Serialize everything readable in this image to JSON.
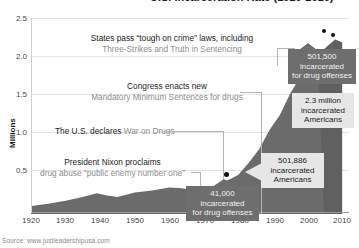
{
  "chart_data": {
    "type": "area",
    "title": "U.S. Incarceration Rate (1920-2010)",
    "xlabel": "",
    "ylabel": "Millions",
    "xlim": [
      1920,
      2012
    ],
    "ylim": [
      0,
      2.6
    ],
    "ytick_labels": [
      "0.5",
      "1.0",
      "1.5",
      "2.0",
      "2.5"
    ],
    "ytick_values": [
      0.5,
      1.0,
      1.5,
      2.0,
      2.5
    ],
    "xtick_labels": [
      "1920",
      "1930",
      "1940",
      "1950",
      "1960",
      "1970",
      "1980",
      "1990",
      "2000",
      "2010"
    ],
    "xtick_values": [
      1920,
      1930,
      1940,
      1950,
      1960,
      1970,
      1980,
      1990,
      2000,
      2010
    ],
    "grid": true,
    "legend": "none",
    "series": [
      {
        "name": "Total incarcerated Americans",
        "color": "#6b6b6b",
        "x": [
          1920,
          1925,
          1930,
          1935,
          1939,
          1942,
          1945,
          1950,
          1955,
          1960,
          1963,
          1966,
          1970,
          1973,
          1975,
          1978,
          1980,
          1983,
          1986,
          1989,
          1992,
          1995,
          1998,
          2000,
          2003,
          2005,
          2008,
          2010
        ],
        "y": [
          0.08,
          0.11,
          0.15,
          0.2,
          0.25,
          0.22,
          0.2,
          0.26,
          0.29,
          0.33,
          0.32,
          0.3,
          0.33,
          0.35,
          0.39,
          0.45,
          0.5,
          0.66,
          0.84,
          1.1,
          1.3,
          1.59,
          1.82,
          1.94,
          2.08,
          2.19,
          2.31,
          2.27
        ]
      }
    ],
    "markers": [
      {
        "x": 1980,
        "y": 0.501886,
        "label": "501,886 incarcerated Americans"
      },
      {
        "x": 2008,
        "y": 2.31,
        "label": "peak"
      },
      {
        "x": 2010,
        "y": 2.27,
        "label": "2010"
      }
    ]
  },
  "axis": {
    "y_label": "Millions",
    "y_ticks": [
      "2.5",
      "2.0",
      "1.5",
      "1.0",
      "0.5"
    ],
    "x_ticks": [
      "1920",
      "1930",
      "1940",
      "1950",
      "1960",
      "1970",
      "1980",
      "1990",
      "2000",
      "2010"
    ]
  },
  "annotations": [
    {
      "id": "tough-on-crime",
      "line1": "States pass “tough on crime” laws, including",
      "line2": "Three-Strikes and Truth in Sentencing"
    },
    {
      "id": "mandatory-minimums",
      "line1": "Congress enacts new",
      "line2": "Mandatory Minimum Sentences for drugs"
    },
    {
      "id": "war-on-drugs",
      "line1": "The U.S. declares",
      "line2": "War on Drugs"
    },
    {
      "id": "nixon",
      "line1": "President Nixon proclaims",
      "line2": "drug abuse “public enemy number one”"
    }
  ],
  "callouts": [
    {
      "id": "drug-offenses-2010",
      "style": "dark",
      "line1": "501,500",
      "line2": "incarcerated",
      "line3": "for drug offenses"
    },
    {
      "id": "total-2010",
      "style": "light",
      "line1": "2.3 million",
      "line2": "incarcerated",
      "line3": "Americans"
    },
    {
      "id": "total-1980",
      "style": "light",
      "line1": "501,886",
      "line2": "incarcerated",
      "line3": "Americans"
    },
    {
      "id": "drug-offenses-1980",
      "style": "dark",
      "line1": "41,000",
      "line2": "incarcerated",
      "line3": "for drug offenses"
    }
  ],
  "source": {
    "text": "Source: www.justleadershipusa.com"
  },
  "colors": {
    "area": "#6b6b6b",
    "area_shadow": "#585858",
    "grid": "#e2e2e2",
    "axis": "#9a9a9a",
    "text_primary": "#1c1c1c",
    "text_secondary": "#8d8d8d",
    "callout_dark_bg": "#6e6e6e",
    "callout_light_bg": "#e6e6e6"
  }
}
